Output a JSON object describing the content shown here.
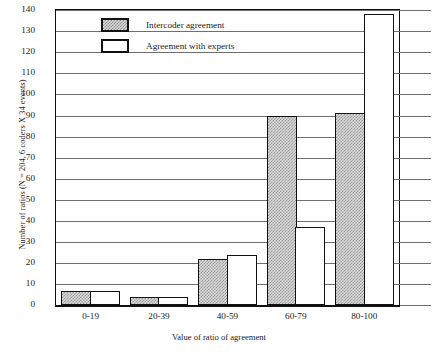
{
  "chart_data": {
    "type": "bar",
    "title": "",
    "categories": [
      "0-19",
      "20-39",
      "40-59",
      "60-79",
      "80-100"
    ],
    "series": [
      {
        "name": "Intercoder agreement",
        "values": [
          7,
          4,
          22,
          90,
          91
        ],
        "style": "dotted-fill"
      },
      {
        "name": "Agreement with experts",
        "values": [
          7,
          4,
          24,
          37,
          138
        ],
        "style": "open-white"
      }
    ],
    "xlabel": "Value of ratio of agreement",
    "ylabel": "Number of ratios (N = 204, 6 coders X 34 events)",
    "ylim": [
      0,
      140
    ],
    "ytick_step": 10,
    "yticks": [
      0,
      10,
      20,
      30,
      40,
      50,
      60,
      70,
      80,
      90,
      100,
      110,
      120,
      130,
      140
    ],
    "ytick_labels": [
      "0",
      "10",
      "20",
      "30",
      "40",
      "50",
      "60",
      "70",
      "80",
      "90",
      "100",
      "110",
      "120",
      "130",
      "140"
    ],
    "grid": true,
    "grid_axis": "y",
    "legend_position": "top-left-inside",
    "colors": {
      "axis": "#111111",
      "grid": "#6e6e6e",
      "series_1_fill": "#d9d9d9",
      "series_1_pattern": "#9b9b9b",
      "series_2_fill": "#ffffff",
      "bar_border": "#111111",
      "background": "#ffffff"
    }
  },
  "legend": {
    "items": [
      {
        "label": "Intercoder agreement",
        "swatch": "dotted"
      },
      {
        "label": "Agreement with experts",
        "swatch": "open"
      }
    ]
  }
}
